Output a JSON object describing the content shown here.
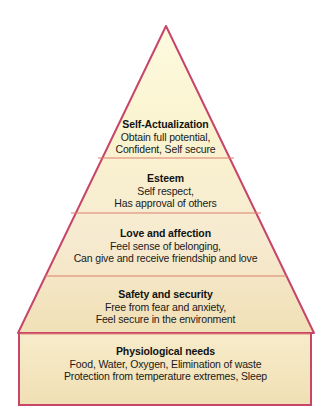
{
  "diagram": {
    "name": "hierarchy-of-needs-pyramid",
    "type": "pyramid",
    "background_color": "#ffffff",
    "outline_color": "#c8456a",
    "divider_color": "#e0806f",
    "fill_top_color": "#fbf6d4",
    "fill_bottom_color": "#f2e2b8"
  },
  "tiers": [
    {
      "id": "self-actualization",
      "level": 5,
      "title": "Self-Actualization",
      "lines": [
        "Obtain full potential,",
        "Confident, Self secure"
      ]
    },
    {
      "id": "esteem",
      "level": 4,
      "title": "Esteem",
      "lines": [
        "Self respect,",
        "Has approval of others"
      ]
    },
    {
      "id": "love-and-affection",
      "level": 3,
      "title": "Love and affection",
      "lines": [
        "Feel sense of belonging,",
        "Can give and receive friendship and love"
      ]
    },
    {
      "id": "safety-and-security",
      "level": 2,
      "title": "Safety and security",
      "lines": [
        "Free from fear and anxiety,",
        "Feel secure in the environment"
      ]
    },
    {
      "id": "physiological-needs",
      "level": 1,
      "title": "Physiological needs",
      "lines": [
        "Food, Water, Oxygen, Elimination of waste",
        "Protection from temperature extremes, Sleep"
      ]
    }
  ]
}
